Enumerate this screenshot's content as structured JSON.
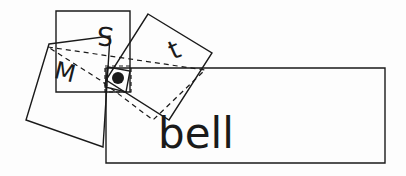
{
  "canvas": {
    "width": 406,
    "height": 176,
    "background_color": "#fdfdfd",
    "stroke_color": "#1a1a1a",
    "description": "hand-drawn style line sketch of overlapping rectangles with letters"
  },
  "shapes": {
    "big_rectangle": {
      "name": "big-rectangle",
      "points": "106,68 385,68 385,163 106,163",
      "style": "solid",
      "rotation_deg": 0
    },
    "upright_square": {
      "name": "upright-square",
      "points": "56,11 130,11 130,92 56,92",
      "style": "solid",
      "rotation_deg": 0
    },
    "tilted_square_right": {
      "name": "tilted-square-right",
      "points": "148,14 212,53 169,120 106,80",
      "style": "solid",
      "rotation_deg": -31
    },
    "tilted_rect_left": {
      "name": "tilted-rectangle-left",
      "points": "49,44 110,36 103,147 26,120",
      "style": "solid",
      "rotation_deg": 20
    },
    "dashed_quad": {
      "name": "dashed-quadrilateral",
      "points": "48,47 205,70 153,120 100,80",
      "style": "dashed"
    },
    "dot_box": {
      "name": "dot-box",
      "points": "105,66 131,66 131,92 105,92",
      "style": "dashed"
    },
    "dot": {
      "name": "center-dot",
      "cx": 118,
      "cy": 78,
      "r": 6,
      "fill": "#1a1a1a"
    }
  },
  "labels": {
    "s_letter": {
      "text": "S",
      "name": "letter-s",
      "x": 106,
      "y": 27,
      "size": 26,
      "rotation_deg": 185
    },
    "t_letter": {
      "text": "t",
      "name": "letter-t",
      "x": 178,
      "y": 58,
      "size": 26,
      "rotation_deg": -24
    },
    "m_letter": {
      "text": "M",
      "name": "letter-m",
      "x": 63,
      "y": 80,
      "size": 24,
      "rotation_deg": 14
    },
    "word_bell": {
      "text": "bell",
      "name": "word-bell",
      "x": 158,
      "y": 148,
      "size": 42,
      "rotation_deg": 0
    }
  }
}
